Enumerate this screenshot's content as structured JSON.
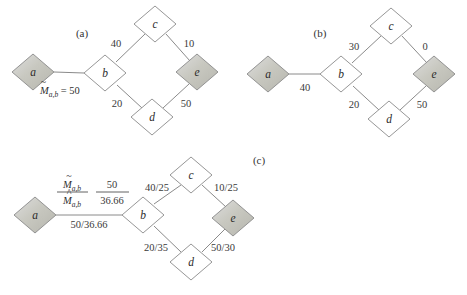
{
  "figure": {
    "background_color": "#ffffff",
    "node_fill_plain": "#ffffff",
    "node_fill_shaded": "#c9c9c2",
    "edge_color": "#7d7d7d"
  },
  "panels": [
    {
      "id": "a",
      "label": "(a)",
      "label_pos": {
        "x": 82,
        "y": 34
      },
      "nodes": [
        {
          "id": "a",
          "letter": "a",
          "x": 33,
          "y": 72,
          "shaded": true
        },
        {
          "id": "b",
          "letter": "b",
          "x": 105,
          "y": 73,
          "shaded": false
        },
        {
          "id": "c",
          "letter": "c",
          "x": 155,
          "y": 24,
          "shaded": false
        },
        {
          "id": "d",
          "letter": "d",
          "x": 152,
          "y": 117,
          "shaded": false
        },
        {
          "id": "e",
          "letter": "e",
          "x": 197,
          "y": 72,
          "shaded": true
        }
      ],
      "edges": [
        {
          "from": "a",
          "to": "b",
          "label": "",
          "label_pos": {
            "x": 0,
            "y": 0
          }
        },
        {
          "from": "b",
          "to": "c",
          "label": "40",
          "label_pos": {
            "x": 116,
            "y": 45
          }
        },
        {
          "from": "c",
          "to": "e",
          "label": "10",
          "label_pos": {
            "x": 189,
            "y": 45
          }
        },
        {
          "from": "b",
          "to": "d",
          "label": "20",
          "label_pos": {
            "x": 117,
            "y": 104
          }
        },
        {
          "from": "d",
          "to": "e",
          "label": "50",
          "label_pos": {
            "x": 186,
            "y": 104
          }
        }
      ],
      "message_label": {
        "text_parts": {
          "m_symbol": "M",
          "accent": "tilde",
          "subscript": "a,b",
          "equals": "=",
          "value": "50"
        },
        "full_text": "M̃a,b = 50",
        "pos": {
          "x": 44,
          "y": 90
        }
      }
    },
    {
      "id": "b",
      "label": "(b)",
      "label_pos": {
        "x": 320,
        "y": 34
      },
      "nodes": [
        {
          "id": "a",
          "letter": "a",
          "x": 268,
          "y": 74,
          "shaded": true
        },
        {
          "id": "b",
          "letter": "b",
          "x": 341,
          "y": 74,
          "shaded": false
        },
        {
          "id": "c",
          "letter": "c",
          "x": 391,
          "y": 26,
          "shaded": false
        },
        {
          "id": "d",
          "letter": "d",
          "x": 389,
          "y": 119,
          "shaded": false
        },
        {
          "id": "e",
          "letter": "e",
          "x": 434,
          "y": 74,
          "shaded": true
        }
      ],
      "edges": [
        {
          "from": "a",
          "to": "b",
          "label": "40",
          "label_pos": {
            "x": 305,
            "y": 88
          }
        },
        {
          "from": "b",
          "to": "c",
          "label": "30",
          "label_pos": {
            "x": 354,
            "y": 47
          }
        },
        {
          "from": "c",
          "to": "e",
          "label": "0",
          "label_pos": {
            "x": 425,
            "y": 47
          }
        },
        {
          "from": "b",
          "to": "d",
          "label": "20",
          "label_pos": {
            "x": 354,
            "y": 105
          }
        },
        {
          "from": "d",
          "to": "e",
          "label": "50",
          "label_pos": {
            "x": 422,
            "y": 105
          }
        }
      ],
      "message_label": null
    },
    {
      "id": "c",
      "label": "(c)",
      "label_pos": {
        "x": 259,
        "y": 161
      },
      "nodes": [
        {
          "id": "a",
          "letter": "a",
          "x": 35,
          "y": 215,
          "shaded": true
        },
        {
          "id": "b",
          "letter": "b",
          "x": 143,
          "y": 215,
          "shaded": false
        },
        {
          "id": "c",
          "letter": "c",
          "x": 191,
          "y": 175,
          "shaded": false
        },
        {
          "id": "d",
          "letter": "d",
          "x": 191,
          "y": 262,
          "shaded": false
        },
        {
          "id": "e",
          "letter": "e",
          "x": 233,
          "y": 218,
          "shaded": true
        }
      ],
      "edges": [
        {
          "from": "a",
          "to": "b",
          "label": "50/36.66",
          "label_pos": {
            "x": 89,
            "y": 225
          }
        },
        {
          "from": "b",
          "to": "c",
          "label": "40/25",
          "label_pos": {
            "x": 157,
            "y": 188
          }
        },
        {
          "from": "c",
          "to": "e",
          "label": "10/25",
          "label_pos": {
            "x": 226,
            "y": 188
          }
        },
        {
          "from": "b",
          "to": "d",
          "label": "20/35",
          "label_pos": {
            "x": 156,
            "y": 248
          }
        },
        {
          "from": "d",
          "to": "e",
          "label": "50/30",
          "label_pos": {
            "x": 223,
            "y": 248
          }
        }
      ],
      "fraction_label": {
        "numerator": {
          "m_symbol": "M",
          "accent": "tilde",
          "subscript": "a,b",
          "full": "M̃a,b"
        },
        "denominator": {
          "m_symbol": "M",
          "accent": "hat",
          "subscript": "a,b",
          "full": "M̂a,b"
        },
        "value_numerator": "50",
        "value_denominator": "36.66",
        "left_frac_pos": {
          "x": 72,
          "y": 194
        },
        "right_frac_pos": {
          "x": 111,
          "y": 194
        }
      }
    }
  ]
}
